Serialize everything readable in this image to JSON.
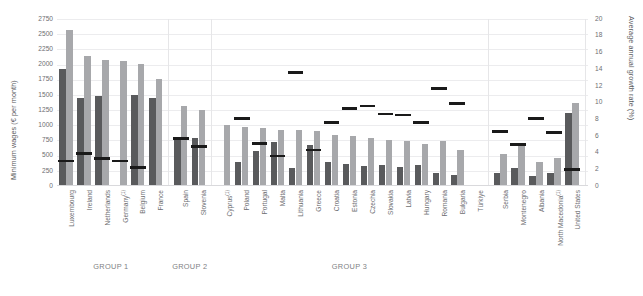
{
  "axes": {
    "left_title": "Minimum wages (€ per month)",
    "right_title": "Average annual growth rate (%)",
    "left_ticks": [
      "2750",
      "2500",
      "2250",
      "2000",
      "1750",
      "1500",
      "1250",
      "1000",
      "750",
      "500",
      "250",
      "0"
    ],
    "right_ticks": [
      "20",
      "18",
      "16",
      "14",
      "12",
      "10",
      "8",
      "6",
      "4",
      "2",
      "0"
    ],
    "left_min": 0,
    "left_max": 2750,
    "right_min": 0,
    "right_max": 20
  },
  "groups": [
    {
      "label": "GROUP 1",
      "count": 6
    },
    {
      "label": "GROUP 2",
      "count": 2
    },
    {
      "label": "GROUP 3",
      "count": 15
    },
    {
      "label": "",
      "count": 5
    },
    {
      "label": "",
      "count": 1
    }
  ],
  "chart_data": {
    "type": "bar",
    "title": "",
    "xlabel": "",
    "ylabel": "Minimum wages (€ per month)",
    "y2label": "Average annual growth rate (%)",
    "ylim": [
      0,
      2750
    ],
    "y2lim": [
      0,
      20
    ],
    "grid": true,
    "legend": "none",
    "categories": [
      "Luxembourg",
      "Ireland",
      "Netherlands",
      "Germany",
      "Belgium",
      "France",
      "Spain",
      "Slovenia",
      "Cyprus",
      "Poland",
      "Portugal",
      "Malta",
      "Lithuania",
      "Greece",
      "Croatia",
      "Estonia",
      "Czechia",
      "Slovakia",
      "Latvia",
      "Hungary",
      "Romania",
      "Bulgaria",
      "Türkiye",
      "Serbia",
      "Montenegro",
      "Albania",
      "North Macedonia",
      "United States"
    ],
    "category_labels": [
      "Luxembourg",
      "Ireland",
      "Netherlands",
      "Germany¹",
      "Belgium",
      "France",
      "Spain",
      "Slovenia",
      "Cyprus¹",
      "Poland",
      "Portugal",
      "Malta",
      "Lithuania",
      "Greece",
      "Croatia",
      "Estonia",
      "Czechia",
      "Slovakia",
      "Latvia",
      "Hungary",
      "Romania",
      "Bulgaria",
      "Türkiye",
      "Serbia",
      "Montenegro",
      "Albania",
      "North Macedonia¹",
      "United States"
    ],
    "series": [
      {
        "name": "Minimum wage (earlier year)",
        "axis": "left",
        "color": "#595a5c",
        "values": [
          1920,
          1450,
          1480,
          0,
          1500,
          1450,
          760,
          790,
          0,
          400,
          570,
          720,
          300,
          680,
          400,
          355,
          330,
          350,
          320,
          340,
          220,
          185,
          0,
          215,
          290,
          160,
          215,
          1200
        ]
      },
      {
        "name": "Minimum wage (later year)",
        "axis": "left",
        "color": "#a7a8ab",
        "values": [
          2570,
          2140,
          2070,
          2060,
          2010,
          1770,
          1320,
          1250,
          1000,
          980,
          960,
          925,
          920,
          910,
          840,
          820,
          790,
          750,
          740,
          700,
          740,
          600,
          0,
          520,
          670,
          400,
          460,
          1370
        ]
      },
      {
        "name": "Average annual growth rate",
        "axis": "right",
        "color": "#1a1a1a",
        "values": [
          3.0,
          3.9,
          3.3,
          3.0,
          2.2,
          null,
          5.7,
          4.7,
          null,
          8.1,
          5.1,
          3.6,
          13.6,
          4.3,
          7.6,
          9.3,
          9.6,
          8.6,
          8.5,
          7.6,
          11.7,
          9.9,
          null,
          6.5,
          5.0,
          8.1,
          6.4,
          2.0
        ]
      }
    ]
  }
}
